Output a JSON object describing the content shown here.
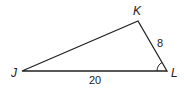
{
  "diagram": {
    "type": "triangle",
    "vertices": [
      {
        "name": "J",
        "x": 22,
        "y": 71,
        "label_x": 11,
        "label_y": 77
      },
      {
        "name": "K",
        "x": 138,
        "y": 21,
        "label_x": 133,
        "label_y": 15
      },
      {
        "name": "L",
        "x": 167,
        "y": 71,
        "label_x": 171,
        "label_y": 77
      }
    ],
    "sides": [
      {
        "between": "JL",
        "label": "20"
      },
      {
        "between": "KL",
        "label": "8"
      }
    ],
    "angle_marker": {
      "vertex": "L"
    },
    "colors": {
      "stroke": "#222222",
      "background": "#ffffff"
    }
  }
}
